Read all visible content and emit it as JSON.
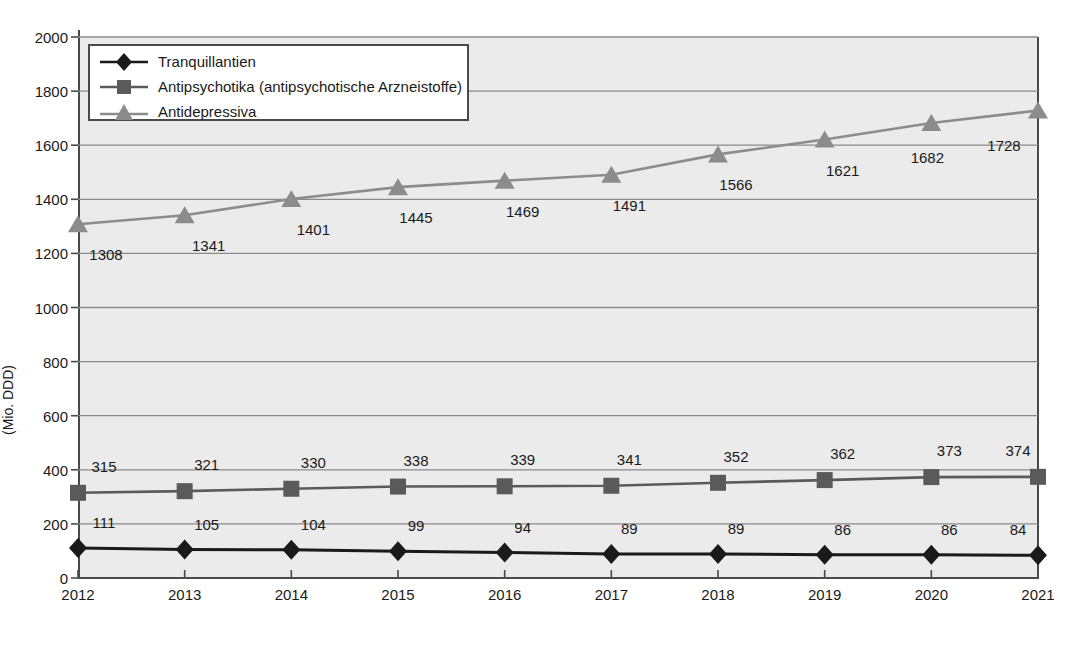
{
  "chart_data": {
    "type": "line",
    "title": "",
    "xlabel": "",
    "ylabel": "(Mio. DDD)",
    "categories": [
      "2012",
      "2013",
      "2014",
      "2015",
      "2016",
      "2017",
      "2018",
      "2019",
      "2020",
      "2021"
    ],
    "ylim": [
      0,
      2000
    ],
    "y_ticks": [
      "0",
      "200",
      "400",
      "600",
      "800",
      "1000",
      "1200",
      "1400",
      "1600",
      "1800",
      "2000"
    ],
    "grid": true,
    "legend_position": "top-left",
    "series": [
      {
        "name": "Tranquillantien",
        "marker": "diamond",
        "color": "#1a1a1a",
        "values": [
          111,
          105,
          104,
          99,
          94,
          89,
          89,
          86,
          86,
          84
        ],
        "labels": [
          "111",
          "105",
          "104",
          "99",
          "94",
          "89",
          "89",
          "86",
          "86",
          "84"
        ]
      },
      {
        "name": "Antipsychotika (antipsychotische Arzneistoffe)",
        "marker": "square",
        "color": "#5a5a5a",
        "values": [
          315,
          321,
          330,
          338,
          339,
          341,
          352,
          362,
          373,
          374
        ],
        "labels": [
          "315",
          "321",
          "330",
          "338",
          "339",
          "341",
          "352",
          "362",
          "373",
          "374"
        ]
      },
      {
        "name": "Antidepressiva",
        "marker": "triangle",
        "color": "#8c8c8c",
        "values": [
          1308,
          1341,
          1401,
          1445,
          1469,
          1491,
          1566,
          1621,
          1682,
          1728
        ],
        "labels": [
          "1308",
          "1341",
          "1401",
          "1445",
          "1469",
          "1491",
          "1566",
          "1621",
          "1682",
          "1728"
        ]
      }
    ],
    "colors": {
      "plot_background": "#ebebeb",
      "gridline": "#8a8a8a",
      "axis": "#4a4a4a",
      "text": "#1a1a1a"
    }
  }
}
